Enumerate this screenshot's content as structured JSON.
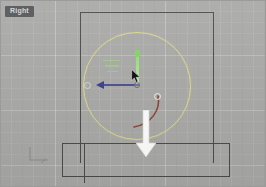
{
  "viewport": {
    "label": "Right",
    "label_color": "#5f6062",
    "background_color": "#a9aaa7",
    "grid_visible": true
  },
  "scene": {
    "selected_object": {
      "name": "circle-sphere",
      "shape": "circle",
      "color": "#ddd98a",
      "selected": true,
      "center_x": 137,
      "center_y": 86,
      "radius": 54
    },
    "geometry": [
      {
        "name": "tall-box",
        "shape": "rectangle",
        "color": "#4b4b49",
        "x": 80,
        "y": 12,
        "width": 134,
        "height": 151
      },
      {
        "name": "bottom-box",
        "shape": "rectangle",
        "color": "#4b4b49",
        "x": 62,
        "y": 143,
        "width": 168,
        "height": 34
      }
    ]
  },
  "gizmo": {
    "type": "move",
    "origin_x": 136,
    "origin_y": 84,
    "axes": [
      {
        "name": "y-axis",
        "label": "Y",
        "color": "#8ce06a",
        "direction": "up",
        "active": true
      },
      {
        "name": "x-axis",
        "label": "X",
        "color": "#4a4f92",
        "direction": "left",
        "active": false
      },
      {
        "name": "z-axis",
        "label": "Z",
        "color": "#efefe9",
        "direction": "screen",
        "active": false
      }
    ],
    "rotation_arc_color": "#8f4236"
  },
  "annotation": {
    "arrow": {
      "name": "down-arrow",
      "direction": "down",
      "color": "#ffffff",
      "x": 134,
      "y": 110
    }
  },
  "cursor": {
    "name": "pointer",
    "color": "#101010",
    "x": 131,
    "y": 69
  },
  "axis_tripod": {
    "name": "axis-tripod",
    "color": "#8d8e8b"
  }
}
